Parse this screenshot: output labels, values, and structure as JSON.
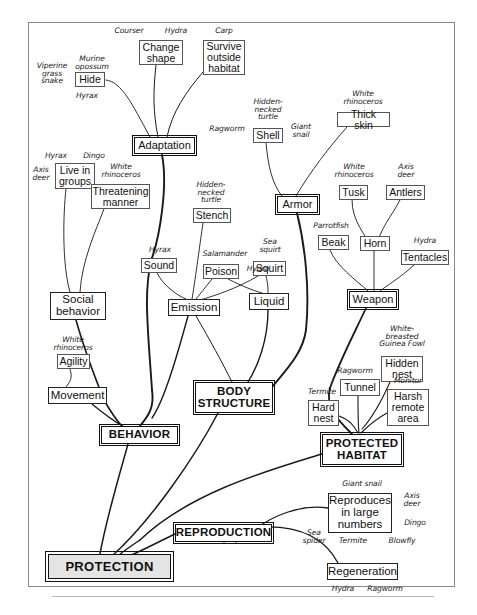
{
  "diagram": {
    "type": "hierarchical-concept-map",
    "root": "PROTECTION",
    "nodes": [
      {
        "id": "protection",
        "label": "PROTECTION",
        "level": "root",
        "x": 48,
        "y": 554,
        "w": 123,
        "h": 25
      },
      {
        "id": "behavior",
        "label": "BEHAVIOR",
        "level": "major-caps",
        "x": 101,
        "y": 426,
        "w": 77,
        "h": 18
      },
      {
        "id": "body-structure",
        "label": "BODY\nSTRUCTURE",
        "level": "major-caps",
        "x": 195,
        "y": 382,
        "w": 78,
        "h": 31
      },
      {
        "id": "protected-habitat",
        "label": "PROTECTED\nHABITAT",
        "level": "major-caps",
        "x": 322,
        "y": 434,
        "w": 80,
        "h": 31
      },
      {
        "id": "reproduction",
        "label": "REPRODUCTION",
        "level": "major-caps",
        "x": 175,
        "y": 524,
        "w": 97,
        "h": 18
      },
      {
        "id": "adaptation",
        "label": "Adaptation",
        "level": "major",
        "x": 134,
        "y": 137,
        "w": 61,
        "h": 17
      },
      {
        "id": "armor",
        "label": "Armor",
        "level": "major",
        "x": 277,
        "y": 196,
        "w": 41,
        "h": 17
      },
      {
        "id": "weapon",
        "label": "Weapon",
        "level": "major",
        "x": 349,
        "y": 291,
        "w": 48,
        "h": 17
      },
      {
        "id": "social-behavior",
        "label": "Social\nbehavior",
        "level": "mid",
        "x": 50,
        "y": 292,
        "w": 56,
        "h": 28
      },
      {
        "id": "emission",
        "label": "Emission",
        "level": "mid",
        "x": 168,
        "y": 299,
        "w": 52,
        "h": 17
      },
      {
        "id": "liquid",
        "label": "Liquid",
        "level": "mid",
        "x": 249,
        "y": 293,
        "w": 40,
        "h": 17
      },
      {
        "id": "movement",
        "label": "Movement",
        "level": "mid",
        "x": 48,
        "y": 387,
        "w": 59,
        "h": 17
      },
      {
        "id": "regeneration",
        "label": "Regeneration",
        "level": "mid",
        "x": 327,
        "y": 563,
        "w": 71,
        "h": 17
      },
      {
        "id": "reproduces",
        "label": "Reproduces\nin large\nnumbers",
        "level": "mid",
        "x": 328,
        "y": 493,
        "w": 64,
        "h": 40
      },
      {
        "id": "hide",
        "label": "Hide",
        "level": "leaf",
        "x": 75,
        "y": 72,
        "w": 30,
        "h": 15
      },
      {
        "id": "change-shape",
        "label": "Change\nshape",
        "level": "leaf",
        "x": 139,
        "y": 40,
        "w": 44,
        "h": 25
      },
      {
        "id": "survive-outside-habitat",
        "label": "Survive\noutside\nhabitat",
        "level": "leaf",
        "x": 203,
        "y": 40,
        "w": 42,
        "h": 35
      },
      {
        "id": "live-in-groups",
        "label": "Live in\ngroups",
        "level": "leaf",
        "x": 55,
        "y": 163,
        "w": 40,
        "h": 26
      },
      {
        "id": "threatening-manner",
        "label": "Threatening\nmanner",
        "level": "leaf",
        "x": 91,
        "y": 184,
        "w": 59,
        "h": 25
      },
      {
        "id": "shell",
        "label": "Shell",
        "level": "leaf",
        "x": 253,
        "y": 128,
        "w": 30,
        "h": 15
      },
      {
        "id": "thick-skin",
        "label": "Thick skin",
        "level": "leaf",
        "x": 337,
        "y": 112,
        "w": 53,
        "h": 15
      },
      {
        "id": "stench",
        "label": "Stench",
        "level": "leaf",
        "x": 193,
        "y": 208,
        "w": 38,
        "h": 15
      },
      {
        "id": "poison",
        "label": "Poison",
        "level": "leaf",
        "x": 203,
        "y": 264,
        "w": 36,
        "h": 15
      },
      {
        "id": "sound",
        "label": "Sound",
        "level": "leaf",
        "x": 141,
        "y": 258,
        "w": 36,
        "h": 15
      },
      {
        "id": "squirt",
        "label": "Squirt",
        "level": "leaf",
        "x": 253,
        "y": 261,
        "w": 33,
        "h": 15
      },
      {
        "id": "tusk",
        "label": "Tusk",
        "level": "leaf",
        "x": 339,
        "y": 185,
        "w": 29,
        "h": 15
      },
      {
        "id": "antlers",
        "label": "Antlers",
        "level": "leaf",
        "x": 386,
        "y": 185,
        "w": 39,
        "h": 15
      },
      {
        "id": "beak",
        "label": "Beak",
        "level": "leaf",
        "x": 318,
        "y": 235,
        "w": 31,
        "h": 15
      },
      {
        "id": "horn",
        "label": "Horn",
        "level": "leaf",
        "x": 360,
        "y": 236,
        "w": 30,
        "h": 15
      },
      {
        "id": "tentacles",
        "label": "Tentacles",
        "level": "leaf",
        "x": 401,
        "y": 250,
        "w": 48,
        "h": 15
      },
      {
        "id": "agility",
        "label": "Agility",
        "level": "leaf",
        "x": 57,
        "y": 354,
        "w": 33,
        "h": 15
      },
      {
        "id": "hidden-nest",
        "label": "Hidden\nnest",
        "level": "leaf",
        "x": 381,
        "y": 356,
        "w": 42,
        "h": 26
      },
      {
        "id": "tunnel",
        "label": "Tunnel",
        "level": "leaf",
        "x": 340,
        "y": 379,
        "w": 40,
        "h": 17
      },
      {
        "id": "hard-nest",
        "label": "Hard\nnest",
        "level": "leaf",
        "x": 308,
        "y": 400,
        "w": 31,
        "h": 26
      },
      {
        "id": "harsh-remote-area",
        "label": "Harsh\nremote\narea",
        "level": "leaf",
        "x": 387,
        "y": 389,
        "w": 42,
        "h": 37
      }
    ],
    "annotations": [
      {
        "id": "ann-courser",
        "text": "Courser",
        "x": 108,
        "y": 27,
        "w": 42
      },
      {
        "id": "ann-hydra-top",
        "text": "Hydra",
        "x": 158,
        "y": 27,
        "w": 36
      },
      {
        "id": "ann-carp",
        "text": "Carp",
        "x": 208,
        "y": 27,
        "w": 32
      },
      {
        "id": "ann-murine-opossum",
        "text": "Murine\nopossum",
        "x": 66,
        "y": 55,
        "w": 52
      },
      {
        "id": "ann-viperine",
        "text": "Viperine\ngrass\nsnake",
        "x": 32,
        "y": 62,
        "w": 40
      },
      {
        "id": "ann-hyrax-hide",
        "text": "Hyrax",
        "x": 69,
        "y": 92,
        "w": 36
      },
      {
        "id": "ann-ragworm-shell",
        "text": "Ragworm",
        "x": 203,
        "y": 125,
        "w": 48
      },
      {
        "id": "ann-hidden-necked-turtle-1",
        "text": "Hidden-\nnecked\nturtle",
        "x": 245,
        "y": 98,
        "w": 46
      },
      {
        "id": "ann-giant-snail-shell",
        "text": "Giant\nsnail",
        "x": 285,
        "y": 123,
        "w": 32
      },
      {
        "id": "ann-white-rhino-thick",
        "text": "White\nrhinoceros",
        "x": 332,
        "y": 90,
        "w": 62
      },
      {
        "id": "ann-hyrax-groups",
        "text": "Hyrax",
        "x": 38,
        "y": 152,
        "w": 36
      },
      {
        "id": "ann-dingo-groups",
        "text": "Dingo",
        "x": 76,
        "y": 152,
        "w": 36
      },
      {
        "id": "ann-axis-deer-groups",
        "text": "Axis\ndeer",
        "x": 28,
        "y": 166,
        "w": 26
      },
      {
        "id": "ann-white-rhino-threat",
        "text": "White\nrhinoceros",
        "x": 90,
        "y": 163,
        "w": 62
      },
      {
        "id": "ann-white-rhino-tusk",
        "text": "White\nrhinoceros",
        "x": 323,
        "y": 163,
        "w": 62
      },
      {
        "id": "ann-axis-deer-antlers",
        "text": "Axis\ndeer",
        "x": 393,
        "y": 163,
        "w": 26
      },
      {
        "id": "ann-hidden-necked-turtle-2",
        "text": "Hidden-\nnecked\nturtle",
        "x": 188,
        "y": 181,
        "w": 46
      },
      {
        "id": "ann-parrotfish",
        "text": "Parrotfish",
        "x": 306,
        "y": 222,
        "w": 50
      },
      {
        "id": "ann-hydra-tentacles",
        "text": "Hydra",
        "x": 407,
        "y": 237,
        "w": 36
      },
      {
        "id": "ann-hyrax-sound",
        "text": "Hyrax",
        "x": 142,
        "y": 246,
        "w": 36
      },
      {
        "id": "ann-salamander",
        "text": "Salamander",
        "x": 196,
        "y": 250,
        "w": 58
      },
      {
        "id": "ann-hydra-poison",
        "text": "Hydra",
        "x": 240,
        "y": 265,
        "w": 36
      },
      {
        "id": "ann-sea-squirt",
        "text": "Sea\nsquirt",
        "x": 254,
        "y": 238,
        "w": 32
      },
      {
        "id": "ann-white-rhino-agility",
        "text": "White\nrhinoceros",
        "x": 42,
        "y": 336,
        "w": 62
      },
      {
        "id": "ann-white-breasted",
        "text": "White-\nbreasted\nGuinea Fowl",
        "x": 367,
        "y": 325,
        "w": 70
      },
      {
        "id": "ann-ragworm-tunnel",
        "text": "Ragworm",
        "x": 331,
        "y": 367,
        "w": 48
      },
      {
        "id": "ann-monitor",
        "text": "Monitor",
        "x": 387,
        "y": 377,
        "w": 42
      },
      {
        "id": "ann-termite-hard",
        "text": "Termite",
        "x": 302,
        "y": 388,
        "w": 40
      },
      {
        "id": "ann-giant-snail-rep",
        "text": "Giant snail",
        "x": 334,
        "y": 480,
        "w": 56
      },
      {
        "id": "ann-axis-deer-rep",
        "text": "Axis\ndeer",
        "x": 398,
        "y": 492,
        "w": 28
      },
      {
        "id": "ann-dingo-rep",
        "text": "Dingo",
        "x": 397,
        "y": 519,
        "w": 36
      },
      {
        "id": "ann-sea-spider",
        "text": "Sea\nspider",
        "x": 297,
        "y": 529,
        "w": 34
      },
      {
        "id": "ann-termite-rep",
        "text": "Termite",
        "x": 333,
        "y": 537,
        "w": 40
      },
      {
        "id": "ann-blowfly",
        "text": "Blowfly",
        "x": 382,
        "y": 537,
        "w": 40
      },
      {
        "id": "ann-hydra-regen",
        "text": "Hydra",
        "x": 325,
        "y": 585,
        "w": 36
      },
      {
        "id": "ann-ragworm-regen",
        "text": "Ragworm",
        "x": 361,
        "y": 585,
        "w": 48
      }
    ],
    "edges": [
      {
        "from": "hide",
        "to": "adaptation"
      },
      {
        "from": "change-shape",
        "to": "adaptation"
      },
      {
        "from": "survive-outside-habitat",
        "to": "adaptation"
      },
      {
        "from": "adaptation",
        "to": "behavior"
      },
      {
        "from": "live-in-groups",
        "to": "social-behavior"
      },
      {
        "from": "threatening-manner",
        "to": "social-behavior"
      },
      {
        "from": "social-behavior",
        "to": "behavior"
      },
      {
        "from": "agility",
        "to": "movement"
      },
      {
        "from": "movement",
        "to": "behavior"
      },
      {
        "from": "emission",
        "to": "behavior"
      },
      {
        "from": "stench",
        "to": "emission"
      },
      {
        "from": "sound",
        "to": "emission"
      },
      {
        "from": "poison",
        "to": "emission"
      },
      {
        "from": "poison",
        "to": "liquid"
      },
      {
        "from": "squirt",
        "to": "liquid"
      },
      {
        "from": "squirt",
        "to": "emission"
      },
      {
        "from": "shell",
        "to": "armor"
      },
      {
        "from": "thick-skin",
        "to": "armor"
      },
      {
        "from": "armor",
        "to": "body-structure"
      },
      {
        "from": "liquid",
        "to": "body-structure"
      },
      {
        "from": "emission",
        "to": "body-structure"
      },
      {
        "from": "tusk",
        "to": "weapon"
      },
      {
        "from": "antlers",
        "to": "weapon"
      },
      {
        "from": "beak",
        "to": "weapon"
      },
      {
        "from": "horn",
        "to": "weapon"
      },
      {
        "from": "tentacles",
        "to": "weapon"
      },
      {
        "from": "weapon",
        "to": "protected-habitat"
      },
      {
        "from": "hidden-nest",
        "to": "protected-habitat"
      },
      {
        "from": "tunnel",
        "to": "protected-habitat"
      },
      {
        "from": "hard-nest",
        "to": "protected-habitat"
      },
      {
        "from": "harsh-remote-area",
        "to": "protected-habitat"
      },
      {
        "from": "behavior",
        "to": "protection"
      },
      {
        "from": "body-structure",
        "to": "protection"
      },
      {
        "from": "protected-habitat",
        "to": "protection"
      },
      {
        "from": "reproduction",
        "to": "protection"
      },
      {
        "from": "reproduces",
        "to": "reproduction"
      },
      {
        "from": "regeneration",
        "to": "reproduction"
      }
    ]
  }
}
